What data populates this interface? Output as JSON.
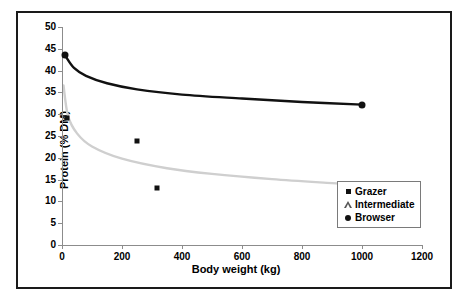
{
  "chart_data": {
    "type": "scatter",
    "title": "",
    "xlabel": "Body weight (kg)",
    "ylabel": "Protein (% DM)",
    "xlim": [
      0,
      1200
    ],
    "ylim": [
      0,
      50
    ],
    "xticks": [
      0,
      200,
      400,
      600,
      800,
      1000,
      1200
    ],
    "yticks": [
      0,
      5,
      10,
      15,
      20,
      25,
      30,
      35,
      40,
      45,
      50
    ],
    "grid": false,
    "legend_position": "center-right",
    "legend": [
      {
        "label": "Grazer",
        "marker": "filled-square",
        "color": "#111111"
      },
      {
        "label": "Intermediate",
        "marker": "open-triangle",
        "color": "#555555"
      },
      {
        "label": "Browser",
        "marker": "filled-circle",
        "color": "#111111"
      }
    ],
    "series": [
      {
        "name": "Browser",
        "marker": "filled-circle",
        "color": "#111111",
        "points": [
          {
            "x": 10,
            "y": 43.5
          },
          {
            "x": 1000,
            "y": 32.2
          }
        ]
      },
      {
        "name": "Grazer",
        "marker": "filled-square",
        "color": "#111111",
        "points": [
          {
            "x": 15,
            "y": 29.2
          },
          {
            "x": 250,
            "y": 23.8
          },
          {
            "x": 315,
            "y": 13.0
          }
        ]
      },
      {
        "name": "Intermediate",
        "marker": "open-triangle",
        "color": "#555555",
        "points": [
          {
            "x": 20,
            "y": 28.4
          },
          {
            "x": 310,
            "y": 32.2
          }
        ]
      }
    ],
    "trendlines": [
      {
        "name": "Browser trend",
        "color": "#111111",
        "width": 2.4,
        "points": [
          {
            "x": 10,
            "y": 43.5
          },
          {
            "x": 40,
            "y": 40.6
          },
          {
            "x": 80,
            "y": 38.8
          },
          {
            "x": 150,
            "y": 37.1
          },
          {
            "x": 250,
            "y": 35.7
          },
          {
            "x": 400,
            "y": 34.5
          },
          {
            "x": 600,
            "y": 33.6
          },
          {
            "x": 800,
            "y": 32.8
          },
          {
            "x": 1000,
            "y": 32.2
          }
        ]
      },
      {
        "name": "Grazer trend",
        "color": "#cfcfcf",
        "width": 2.4,
        "points": [
          {
            "x": 5,
            "y": 36.6
          },
          {
            "x": 20,
            "y": 29.6
          },
          {
            "x": 50,
            "y": 25.6
          },
          {
            "x": 100,
            "y": 22.6
          },
          {
            "x": 200,
            "y": 19.8
          },
          {
            "x": 350,
            "y": 17.6
          },
          {
            "x": 500,
            "y": 16.3
          },
          {
            "x": 700,
            "y": 15.1
          },
          {
            "x": 900,
            "y": 14.2
          },
          {
            "x": 1070,
            "y": 13.5
          }
        ]
      }
    ]
  }
}
